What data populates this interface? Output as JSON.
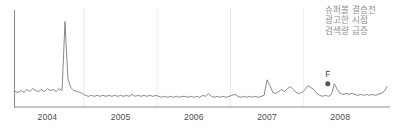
{
  "annotation": {
    "id": "superbowl-ad-note",
    "lines": [
      "슈퍼볼 결승전",
      "광고한 시점",
      "검색량 급증"
    ],
    "color": "#8d8d8d"
  },
  "marked_point": {
    "label": "F",
    "x_value": 2007.83,
    "y_value": 24,
    "marker": "filled-circle",
    "color": "#555555"
  },
  "chart_data": {
    "type": "line",
    "title": "",
    "subtitle": "",
    "xlabel": "",
    "ylabel": "",
    "xlim": [
      2003.55,
      2008.68
    ],
    "ylim": [
      0,
      100
    ],
    "grid": {
      "vertical": true,
      "horizontal": false,
      "color": "#ebebeb",
      "positions": [
        2004.5,
        2005.5,
        2006.5,
        2007.5
      ]
    },
    "axes": {
      "left_spine": true,
      "bottom_spine": true,
      "spine_color": "#8c8c8c"
    },
    "legend": {
      "show": false,
      "position": "none"
    },
    "xtick_labels": [
      "2004",
      "2005",
      "2006",
      "2007",
      "2008"
    ],
    "xtick_values": [
      2004.0,
      2005.0,
      2006.0,
      2007.0,
      2008.0
    ],
    "series": [
      {
        "name": "검색량",
        "color": "#7a7a7a",
        "linewidth": 0.9,
        "x": [
          2003.56,
          2003.6,
          2003.64,
          2003.68,
          2003.72,
          2003.76,
          2003.8,
          2003.84,
          2003.88,
          2003.92,
          2003.96,
          2004.0,
          2004.04,
          2004.08,
          2004.12,
          2004.16,
          2004.2,
          2004.24,
          2004.28,
          2004.32,
          2004.36,
          2004.4,
          2004.44,
          2004.48,
          2004.52,
          2004.56,
          2004.6,
          2004.64,
          2004.68,
          2004.72,
          2004.76,
          2004.8,
          2004.84,
          2004.88,
          2004.92,
          2004.96,
          2005.0,
          2005.04,
          2005.08,
          2005.12,
          2005.16,
          2005.2,
          2005.24,
          2005.28,
          2005.32,
          2005.36,
          2005.4,
          2005.44,
          2005.48,
          2005.52,
          2005.56,
          2005.6,
          2005.64,
          2005.68,
          2005.72,
          2005.76,
          2005.8,
          2005.84,
          2005.88,
          2005.92,
          2005.96,
          2006.0,
          2006.04,
          2006.08,
          2006.12,
          2006.16,
          2006.2,
          2006.24,
          2006.28,
          2006.32,
          2006.36,
          2006.4,
          2006.44,
          2006.48,
          2006.52,
          2006.56,
          2006.6,
          2006.64,
          2006.68,
          2006.72,
          2006.76,
          2006.8,
          2006.84,
          2006.88,
          2006.92,
          2006.96,
          2007.0,
          2007.04,
          2007.08,
          2007.12,
          2007.16,
          2007.2,
          2007.24,
          2007.28,
          2007.32,
          2007.36,
          2007.4,
          2007.44,
          2007.48,
          2007.52,
          2007.56,
          2007.6,
          2007.64,
          2007.68,
          2007.72,
          2007.76,
          2007.8,
          2007.84,
          2007.88,
          2007.92,
          2007.96,
          2008.0,
          2008.04,
          2008.08,
          2008.12,
          2008.16,
          2008.2,
          2008.24,
          2008.28,
          2008.32,
          2008.36,
          2008.4,
          2008.44,
          2008.48,
          2008.52,
          2008.56,
          2008.6,
          2008.64
        ],
        "values": [
          16,
          15,
          17,
          15,
          18,
          16,
          19,
          17,
          16,
          18,
          16,
          19,
          17,
          18,
          16,
          19,
          17,
          88,
          29,
          20,
          17,
          16,
          15,
          14,
          12,
          11,
          12,
          11,
          12,
          11,
          12,
          11,
          12,
          11,
          12,
          11,
          12,
          11,
          12,
          11,
          13,
          11,
          12,
          11,
          12,
          11,
          12,
          11,
          12,
          11,
          10,
          11,
          10,
          11,
          10,
          11,
          10,
          11,
          11,
          10,
          11,
          10,
          11,
          10,
          12,
          11,
          14,
          11,
          10,
          11,
          10,
          11,
          10,
          11,
          12,
          13,
          11,
          10,
          11,
          10,
          11,
          10,
          11,
          10,
          11,
          12,
          28,
          22,
          15,
          14,
          16,
          18,
          16,
          19,
          21,
          18,
          15,
          14,
          15,
          18,
          22,
          20,
          18,
          14,
          12,
          11,
          12,
          11,
          13,
          24,
          18,
          14,
          13,
          14,
          13,
          14,
          13,
          12,
          13,
          12,
          13,
          12,
          13,
          12,
          13,
          14,
          16,
          21
        ]
      }
    ],
    "annotations": [
      {
        "text_lines": [
          "슈퍼볼 결승전",
          "광고한 시점",
          "검색량 급증"
        ],
        "x": 2008.15,
        "y": 92
      },
      {
        "text": "F",
        "x": 2007.83,
        "y": 32,
        "marker_at": {
          "x": 2007.83,
          "y": 24
        }
      }
    ]
  }
}
